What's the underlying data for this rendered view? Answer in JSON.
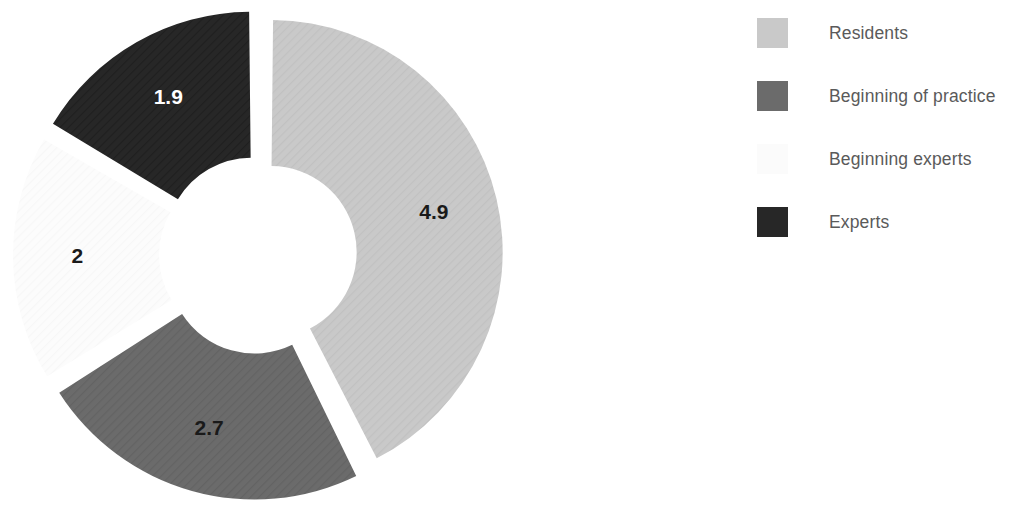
{
  "chart_data": {
    "type": "pie",
    "variant": "doughnut-exploded",
    "title": "",
    "categories": [
      "Residents",
      "Beginning of practice",
      "Beginning experts",
      "Experts"
    ],
    "values": [
      4.9,
      2.7,
      2,
      1.9
    ],
    "labels": [
      "4.9",
      "2.7",
      "2",
      "1.9"
    ],
    "total": 11.5,
    "colors": [
      "#c9c9c9",
      "#6b6b6b",
      "#fbfbfb",
      "#272727"
    ],
    "label_colors": [
      "#1a1a1a",
      "#1a1a1a",
      "#1a1a1a",
      "#ffffff"
    ],
    "start_angle_deg": 0,
    "direction": "clockwise",
    "explode": true,
    "hole_ratio": 0.37,
    "legend_position": "right",
    "grid": false,
    "xlabel": "",
    "ylabel": ""
  },
  "legend": {
    "items": [
      {
        "label": "Residents",
        "color": "#c9c9c9"
      },
      {
        "label": "Beginning of practice",
        "color": "#6b6b6b"
      },
      {
        "label": "Beginning experts",
        "color": "#fbfbfb"
      },
      {
        "label": "Experts",
        "color": "#272727"
      }
    ]
  },
  "slices": [
    {
      "name": "Residents",
      "value": "4.9"
    },
    {
      "name": "Beginning of practice",
      "value": "2.7"
    },
    {
      "name": "Beginning experts",
      "value": "2"
    },
    {
      "name": "Experts",
      "value": "1.9"
    }
  ]
}
